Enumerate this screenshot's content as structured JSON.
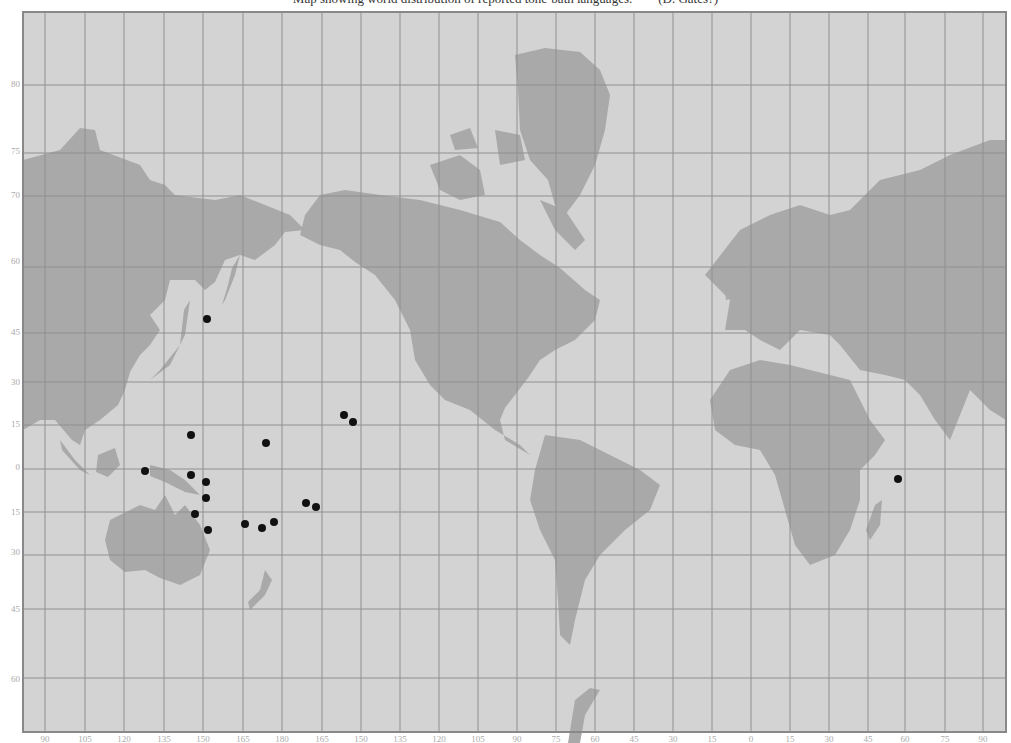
{
  "title": "Map showing world distribution of reported tone-bath languages.        (D. Gates?)",
  "colors": {
    "ocean": "#d3d3d3",
    "land": "#a9a9a9",
    "grid": "#8f8f8f",
    "frame": "#888888",
    "point": "#111111",
    "label": "#aaaaaa"
  },
  "frame": {
    "x": 23,
    "y": 12,
    "width": 983,
    "height": 720
  },
  "grid": {
    "verticals_x": [
      45,
      85,
      124,
      164,
      203,
      243,
      282,
      322,
      361,
      400,
      439,
      478,
      517,
      556,
      595,
      634,
      673,
      712,
      751,
      790,
      829,
      868,
      905,
      945,
      983
    ],
    "horizontals_y": [
      85,
      153,
      196,
      267,
      333,
      382,
      425,
      469,
      512,
      555,
      609,
      678
    ]
  },
  "lat_labels": [
    {
      "text": "80",
      "y": 85
    },
    {
      "text": "75",
      "y": 152
    },
    {
      "text": "70",
      "y": 196
    },
    {
      "text": "60",
      "y": 262
    },
    {
      "text": "45",
      "y": 333
    },
    {
      "text": "30",
      "y": 383
    },
    {
      "text": "15",
      "y": 425
    },
    {
      "text": "0",
      "y": 468
    },
    {
      "text": "15",
      "y": 513
    },
    {
      "text": "30",
      "y": 553
    },
    {
      "text": "45",
      "y": 610
    },
    {
      "text": "60",
      "y": 680
    }
  ],
  "lon_labels": [
    {
      "text": "90",
      "x": 45
    },
    {
      "text": "105",
      "x": 85
    },
    {
      "text": "120",
      "x": 124
    },
    {
      "text": "135",
      "x": 164
    },
    {
      "text": "150",
      "x": 203
    },
    {
      "text": "165",
      "x": 243
    },
    {
      "text": "180",
      "x": 282
    },
    {
      "text": "165",
      "x": 322
    },
    {
      "text": "150",
      "x": 361
    },
    {
      "text": "135",
      "x": 400
    },
    {
      "text": "120",
      "x": 439
    },
    {
      "text": "105",
      "x": 478
    },
    {
      "text": "90",
      "x": 517
    },
    {
      "text": "75",
      "x": 556
    },
    {
      "text": "60",
      "x": 595
    },
    {
      "text": "45",
      "x": 634
    },
    {
      "text": "30",
      "x": 673
    },
    {
      "text": "15",
      "x": 712
    },
    {
      "text": "0",
      "x": 751
    },
    {
      "text": "15",
      "x": 790
    },
    {
      "text": "30",
      "x": 829
    },
    {
      "text": "45",
      "x": 868
    },
    {
      "text": "60",
      "x": 905
    },
    {
      "text": "75",
      "x": 945
    },
    {
      "text": "90",
      "x": 983
    }
  ],
  "points": [
    {
      "x": 207,
      "y": 319
    },
    {
      "x": 191,
      "y": 435
    },
    {
      "x": 266,
      "y": 443
    },
    {
      "x": 344,
      "y": 415
    },
    {
      "x": 353,
      "y": 422
    },
    {
      "x": 145,
      "y": 471
    },
    {
      "x": 191,
      "y": 475
    },
    {
      "x": 206,
      "y": 482
    },
    {
      "x": 206,
      "y": 498
    },
    {
      "x": 195,
      "y": 514
    },
    {
      "x": 208,
      "y": 530
    },
    {
      "x": 245,
      "y": 524
    },
    {
      "x": 262,
      "y": 528
    },
    {
      "x": 274,
      "y": 522
    },
    {
      "x": 306,
      "y": 503
    },
    {
      "x": 316,
      "y": 507
    },
    {
      "x": 898,
      "y": 479
    }
  ],
  "land": [
    {
      "name": "asia-east",
      "d": "M23,160 L60,150 L80,128 L95,130 L100,150 L140,165 L150,180 L165,185 L175,195 L215,200 L240,195 L265,205 L290,215 L305,230 L285,232 L275,245 L255,260 L240,255 L225,260 L215,282 L205,290 L195,280 L170,280 L165,300 L150,315 L160,330 L150,345 L140,355 L130,372 L125,390 L118,405 L100,420 L85,430 L80,445 L72,440 L55,420 L40,420 L23,430 Z"
    },
    {
      "name": "kamchatka",
      "d": "M240,255 L235,275 L225,300 L222,305 L228,285 L232,268 Z"
    },
    {
      "name": "japan",
      "d": "M190,300 L185,335 L170,365 L150,380 L160,370 L180,345 L184,310 Z"
    },
    {
      "name": "indochina-sumatra",
      "d": "M60,440 L75,460 L90,475 L80,470 L62,450 Z"
    },
    {
      "name": "borneo",
      "d": "M98,455 L115,448 L120,465 L108,477 L96,472 Z"
    },
    {
      "name": "new-guinea",
      "d": "M150,465 L170,470 L185,480 L200,495 L185,492 L165,482 L150,476 Z"
    },
    {
      "name": "australia",
      "d": "M110,520 L140,505 L155,510 L165,495 L175,515 L185,505 L200,525 L210,550 L200,575 L180,585 L160,578 L145,570 L125,572 L110,560 L105,540 Z"
    },
    {
      "name": "new-zealand",
      "d": "M265,570 L272,580 L265,595 L250,610 L248,602 L260,590 Z"
    },
    {
      "name": "north-america",
      "d": "M320,195 L345,190 L380,195 L420,200 L460,210 L500,222 L520,240 L540,255 L560,268 L585,290 L600,300 L595,320 L575,340 L555,350 L540,360 L528,378 L515,395 L505,408 L500,420 L505,440 L530,455 L520,445 L495,430 L470,410 L445,400 L430,385 L415,360 L410,330 L395,300 L375,275 L355,262 L340,250 L320,245 L300,235 L305,215 Z"
    },
    {
      "name": "greenland",
      "d": "M515,55 L545,48 L580,52 L600,70 L610,95 L605,130 L595,165 L580,195 L565,215 L555,205 L548,180 L530,160 L520,130 L518,90 Z"
    },
    {
      "name": "arctic-islands",
      "d": "M430,165 L460,155 L480,170 L485,195 L460,200 L440,190 Z M495,130 L520,135 L525,160 L500,165 Z M450,135 L470,128 L478,148 L455,150 Z M540,200 L565,210 L585,240 L575,250 L555,230 Z"
    },
    {
      "name": "south-america",
      "d": "M545,435 L580,440 L610,455 L640,470 L660,485 L650,510 L625,530 L600,555 L585,580 L575,620 L570,645 L560,635 L558,600 L555,560 L540,530 L530,500 L535,470 Z"
    },
    {
      "name": "europe-asia",
      "d": "M705,275 L740,230 L770,215 L800,205 L830,215 L850,210 L880,180 L920,170 L950,155 L990,140 L1006,140 L1006,420 L990,410 L970,390 L960,415 L950,440 L935,420 L920,395 L905,380 L885,375 L860,370 L840,345 L830,335 L800,330 L780,350 L760,340 L745,330 L725,330 L730,300 Z"
    },
    {
      "name": "uk",
      "d": "M740,280 L750,275 L755,300 L745,305 Z M725,290 L732,288 L733,298 L726,300 Z"
    },
    {
      "name": "africa",
      "d": "M710,400 L730,370 L760,360 L790,365 L830,375 L850,380 L870,420 L885,440 L875,455 L860,470 L860,500 L850,530 L835,555 L810,565 L795,545 L785,510 L775,475 L760,450 L735,445 L715,430 Z"
    },
    {
      "name": "madagascar",
      "d": "M875,505 L882,500 L880,525 L870,540 L866,530 Z"
    },
    {
      "name": "antarctic-peninsula",
      "d": "M568,743 L575,700 L590,688 L600,690 L585,715 L580,743 Z"
    }
  ]
}
